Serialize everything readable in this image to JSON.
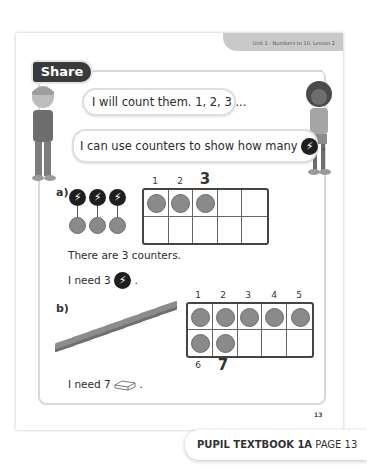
{
  "header": {
    "unit_label": "Unit 1 : Numbers to 10, Lesson 2"
  },
  "section": {
    "title": "Share"
  },
  "speech": {
    "boy": "I will count them. 1, 2, 3 ...",
    "girl_prefix": "I can use counters to show how many",
    "girl_suffix": ".",
    "girl_icon": "lightning-counter-icon"
  },
  "part_a": {
    "label": "a)",
    "items_count": 3,
    "item_icon": "lightning-counter-icon",
    "frame_numbers": [
      "1",
      "2",
      "3"
    ],
    "frame_filled": 3,
    "statement": "There are 3 counters.",
    "need_prefix": "I need 3",
    "need_suffix": "."
  },
  "part_b": {
    "label": "b)",
    "bricks_count": 7,
    "item_icon": "brick-icon",
    "frame_top_numbers": [
      "1",
      "2",
      "3",
      "4",
      "5"
    ],
    "frame_bottom_numbers": [
      "6",
      "7"
    ],
    "frame_filled": 7,
    "need_prefix": "I need 7",
    "need_suffix": "."
  },
  "page_number": "13",
  "footer": {
    "book": "PUPIL TEXTBOOK 1A",
    "page": "PAGE 13"
  },
  "colors": {
    "dark": "#3a3a3a",
    "counter": "#8a8a8a",
    "tab": "#c9c9c9"
  }
}
